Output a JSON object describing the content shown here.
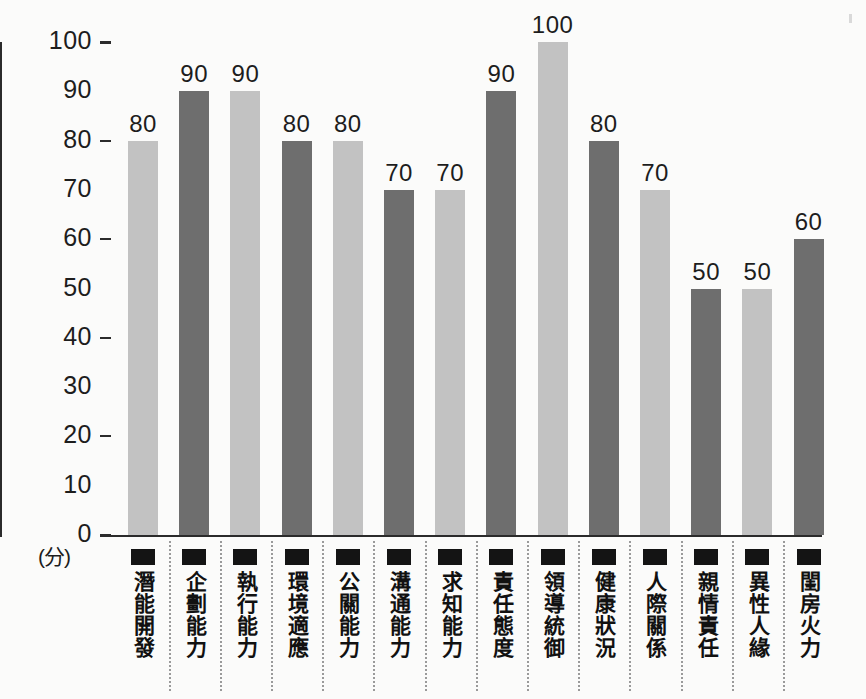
{
  "chart_data": {
    "type": "bar",
    "title": "",
    "xlabel": "",
    "ylabel": "(分)",
    "ylim": [
      0,
      100
    ],
    "ytick_step": 10,
    "ytick_labels": [
      "100",
      "90",
      "80",
      "70",
      "60",
      "50",
      "40",
      "30",
      "20",
      "10",
      "0"
    ],
    "major_ticks": [
      100,
      80,
      60,
      40,
      20,
      0
    ],
    "grid": false,
    "legend": "none",
    "categories": [
      "潛能開發",
      "企劃能力",
      "執行能力",
      "環境適應",
      "公關能力",
      "溝通能力",
      "求知能力",
      "責任態度",
      "領導統御",
      "健康狀況",
      "人際關係",
      "親情責任",
      "異性人緣",
      "閨房火力"
    ],
    "values": [
      80,
      90,
      90,
      80,
      80,
      70,
      70,
      90,
      100,
      80,
      70,
      50,
      50,
      60
    ],
    "bar_shades": [
      "light",
      "dark",
      "light",
      "dark",
      "light",
      "dark",
      "light",
      "dark",
      "light",
      "dark",
      "light",
      "dark",
      "light",
      "dark"
    ],
    "colors": {
      "light_bar": "#c2c2c2",
      "dark_bar": "#6e6e6e",
      "axis": "#2b2b2b",
      "text": "#1d1d1d",
      "marker": "#141414",
      "separator": "#9a9a9a",
      "background": "#fbfbfa"
    }
  }
}
